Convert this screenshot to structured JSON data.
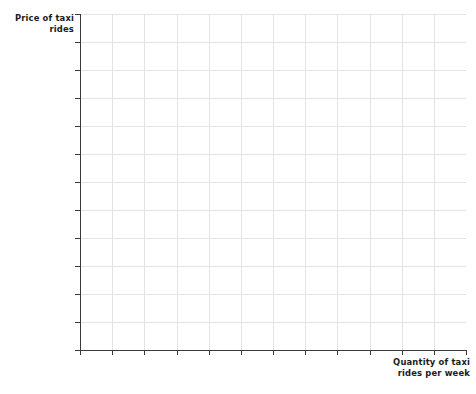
{
  "figure": {
    "kind": "blank-coordinate-grid",
    "background_color": "#ffffff"
  },
  "labels": {
    "y_axis": "Price of taxi\nrides",
    "x_axis": "Quantity of taxi\nrides per week"
  },
  "colors": {
    "axis": "#3a3a3a",
    "grid": "#e3e3e3",
    "text": "#1b1b1b",
    "background": "#ffffff"
  },
  "chart_data": {
    "type": "line",
    "title": "",
    "subtitle": "",
    "xlabel": "Quantity of taxi rides per week",
    "ylabel": "Price of taxi rides",
    "series": [],
    "categories": [],
    "x": [],
    "values": [],
    "annotations": [],
    "legend": [],
    "legend_position": "none",
    "grid": true,
    "xlim": [
      0,
      12
    ],
    "ylim": [
      0,
      12
    ],
    "xticks": [
      0,
      1,
      2,
      3,
      4,
      5,
      6,
      7,
      8,
      9,
      10,
      11,
      12
    ],
    "yticks": [
      0,
      1,
      2,
      3,
      4,
      5,
      6,
      7,
      8,
      9,
      10,
      11,
      12
    ],
    "xtick_labels": [],
    "ytick_labels": [],
    "n_columns": 12,
    "n_rows": 12,
    "note": "Empty grid provided for plotting a supply-and-demand graph; no data series drawn."
  },
  "geometry": {
    "plot_left": 80,
    "plot_top": 14,
    "plot_width": 386,
    "plot_height": 336,
    "tick_length": 5
  }
}
